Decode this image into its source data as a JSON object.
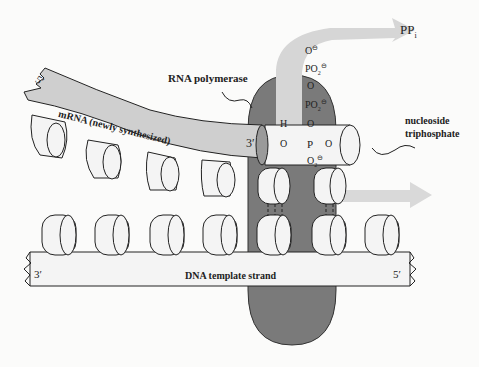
{
  "diagram": {
    "type": "transcription",
    "colors": {
      "background": "#fbfbfa",
      "polymerase": "#7a7a7a",
      "mrna": "#cfcfcf",
      "arrow": "#d6d6d6",
      "base": "#f4f4f4",
      "outline": "#222222"
    },
    "labels": {
      "rna_polymerase": "RNA polymerase",
      "mrna": "mRNA (newly synthesized)",
      "nucleoside_triphosphate_line1": "nucleoside",
      "nucleoside_triphosphate_line2": "triphosphate",
      "dna_template": "DNA template strand",
      "ppi": "PP",
      "ppi_sub": "i",
      "mrna_5prime": "5′",
      "mrna_3prime": "3′",
      "dna_3prime": "3′",
      "dna_5prime": "5′"
    },
    "chemistry": {
      "o_top": "O",
      "po2_1": "PO",
      "o_mid": "O",
      "po2_2": "PO",
      "o_link": "O",
      "h": "H",
      "o_3prime": "O",
      "p": "P",
      "o_right": "O",
      "o2_bottom": "O",
      "sub2": "2",
      "minus": "⊖"
    }
  }
}
